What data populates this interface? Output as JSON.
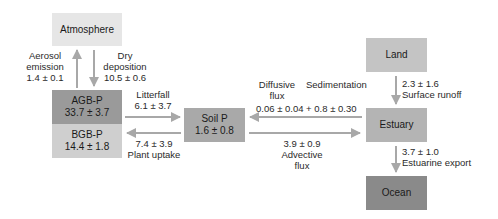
{
  "colors": {
    "atmosphere": "#e6e6e6",
    "agb": "#9a9a9a",
    "bgb": "#cfcfcf",
    "soil": "#a9a9a9",
    "land": "#c4c4c4",
    "estuary": "#b4b4b4",
    "ocean": "#8a8a8a",
    "arrow": "#a8a8a8"
  },
  "nodes": {
    "atmosphere": {
      "label": "Atmosphere"
    },
    "agb": {
      "label": "AGB-P",
      "value": "33.7 ± 3.7"
    },
    "bgb": {
      "label": "BGB-P",
      "value": "14.4 ± 1.8"
    },
    "soil": {
      "label": "Soil P",
      "value": "1.6 ± 0.8"
    },
    "land": {
      "label": "Land"
    },
    "estuary": {
      "label": "Estuary"
    },
    "ocean": {
      "label": "Ocean"
    }
  },
  "fluxes": {
    "aerosol": {
      "line1": "Aerosol",
      "line2": "emission",
      "value": "1.4 ± 0.1"
    },
    "dry_dep": {
      "line1": "Dry",
      "line2": "deposition",
      "value": "10.5 ± 0.6"
    },
    "litterfall": {
      "label": "Litterfall",
      "value": "6.1 ± 3.7"
    },
    "uptake": {
      "label": "Plant uptake",
      "value": "7.4 ± 3.9"
    },
    "diffusive": {
      "line1": "Diffusive",
      "line2": "flux"
    },
    "sedimentation": {
      "label": "Sedimentation"
    },
    "diff_sed_value": "0.06 ± 0.04 + 0.8 ± 0.30",
    "advective": {
      "value": "3.9 ± 0.9",
      "line1": "Advective",
      "line2": "flux"
    },
    "runoff": {
      "value": "2.3 ± 1.6",
      "label": "Surface runoff"
    },
    "export": {
      "value": "3.7 ± 1.0",
      "label": "Estuarine export"
    }
  }
}
